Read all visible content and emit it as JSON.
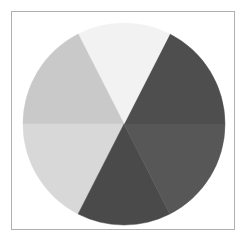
{
  "figure": {
    "background_color": "#ffffff",
    "frame": {
      "border_color": "#b0b0b0",
      "fill_color": "#ffffff",
      "x": 11,
      "y": 11,
      "width": 224,
      "height": 219
    }
  },
  "chart_data": {
    "type": "pie",
    "title": "",
    "subtitle": "",
    "xlabel": "",
    "ylabel": "",
    "legend": false,
    "legend_position": "none",
    "grid": false,
    "labels_shown": false,
    "center_x": 124,
    "center_y": 124,
    "radius": 101,
    "start_angle_deg": 0,
    "direction": "counterclockwise",
    "categories": [
      "Slice 1",
      "Slice 2",
      "Slice 3",
      "Slice 4",
      "Slice 5",
      "Slice 6"
    ],
    "values": [
      17.5,
      15.0,
      17.5,
      17.5,
      15.0,
      17.5
    ],
    "angles_deg": [
      63,
      54,
      63,
      63,
      54,
      63
    ],
    "colors": [
      "#4e4e4e",
      "#4a4a4a",
      "#4f4f4f",
      "#d2d2d2",
      "#d8d8d8",
      "#f2f2f2"
    ],
    "slices": [
      {
        "label": "Slice 1",
        "value": 17.5,
        "start_deg": 0,
        "end_deg": 63,
        "color": "#4e4e4e",
        "position": "right-upper"
      },
      {
        "label": "Slice 2",
        "value": 15.0,
        "start_deg": 63,
        "end_deg": 117,
        "color": "#f2f2f2",
        "position": "top"
      },
      {
        "label": "Slice 3",
        "value": 17.5,
        "start_deg": 117,
        "end_deg": 180,
        "color": "#c9c9c9",
        "position": "left-upper"
      },
      {
        "label": "Slice 4",
        "value": 17.5,
        "start_deg": 180,
        "end_deg": 243,
        "color": "#d8d8d8",
        "position": "left-lower"
      },
      {
        "label": "Slice 5",
        "value": 15.0,
        "start_deg": 243,
        "end_deg": 297,
        "color": "#4a4a4a",
        "position": "bottom"
      },
      {
        "label": "Slice 6",
        "value": 17.5,
        "start_deg": 297,
        "end_deg": 360,
        "color": "#575757",
        "position": "right-lower"
      }
    ]
  }
}
